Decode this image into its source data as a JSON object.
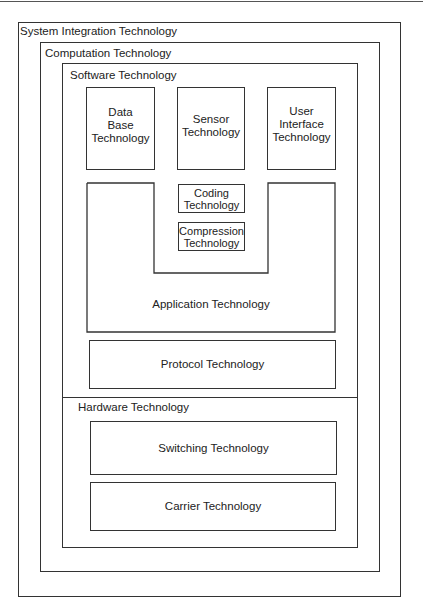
{
  "diagram": {
    "system": {
      "label": "System Integration Technology"
    },
    "computation": {
      "label": "Computation Technology"
    },
    "software": {
      "label": "Software Technology",
      "top_boxes": [
        {
          "label": "Data\nBase\nTechnology"
        },
        {
          "label": "Sensor\nTechnology"
        },
        {
          "label": "User\nInterface\nTechnology"
        }
      ],
      "application": {
        "label": "Application Technology",
        "inner_boxes": [
          {
            "label": "Coding\nTechnology"
          },
          {
            "label": "Compression\nTechnology"
          }
        ]
      },
      "protocol": {
        "label": "Protocol Technology"
      }
    },
    "hardware": {
      "label": "Hardware Technology",
      "boxes": [
        {
          "label": "Switching Technology"
        },
        {
          "label": "Carrier Technology"
        }
      ]
    }
  }
}
